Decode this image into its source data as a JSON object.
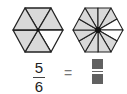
{
  "left_hexagon": {
    "parts": 6,
    "shaded": 5,
    "fill": "#d9d9d9",
    "unshaded_fill": "#ffffff",
    "stroke": "#222222"
  },
  "right_hexagon": {
    "parts": 12,
    "shaded": 10,
    "fill": "#d9d9d9",
    "unshaded_fill": "#ffffff",
    "stroke": "#222222"
  },
  "left_fraction": {
    "numerator": "5",
    "denominator": "6"
  },
  "equals_sign": "=",
  "right_fraction": {
    "numerator": "",
    "denominator": "",
    "placeholder": "dotted boxes"
  }
}
